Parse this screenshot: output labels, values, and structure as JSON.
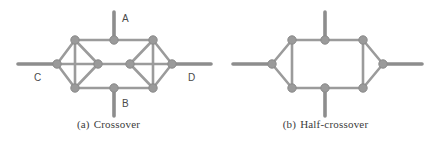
{
  "figure": {
    "width": 434,
    "height": 144,
    "background": "#ffffff",
    "colors": {
      "edge": "#9b9b9b",
      "node_fill": "#9a9a9a",
      "node_stroke": "#8a8a8a",
      "terminal_stem": "#8d8d8d",
      "label_text": "#4a4a4a",
      "caption_text": "#3b3b3b"
    },
    "stroke_widths": {
      "edge": 2.6,
      "terminal_stem": 3.6,
      "node_radius": 4.2
    }
  },
  "panels": [
    {
      "id": "crossover",
      "caption_tag": "(a)",
      "caption_text": "Crossover",
      "type": "graph",
      "nodes": [
        {
          "id": "tl",
          "name": "top-left-node",
          "x": 75,
          "y": 40
        },
        {
          "id": "tm",
          "name": "top-middle-node",
          "x": 114,
          "y": 40
        },
        {
          "id": "tr",
          "name": "top-right-node",
          "x": 153,
          "y": 40
        },
        {
          "id": "bl",
          "name": "bottom-left-node",
          "x": 75,
          "y": 88
        },
        {
          "id": "bm",
          "name": "bottom-middle-node",
          "x": 114,
          "y": 88
        },
        {
          "id": "br",
          "name": "bottom-right-node",
          "x": 153,
          "y": 88
        },
        {
          "id": "lw",
          "name": "left-west-node",
          "x": 57,
          "y": 64
        },
        {
          "id": "cl",
          "name": "center-left-node",
          "x": 98,
          "y": 64
        },
        {
          "id": "cr",
          "name": "center-right-node",
          "x": 130,
          "y": 64
        },
        {
          "id": "re",
          "name": "right-east-node",
          "x": 172,
          "y": 64
        }
      ],
      "edges": [
        {
          "from": "tl",
          "to": "tm"
        },
        {
          "from": "tm",
          "to": "tr"
        },
        {
          "from": "bl",
          "to": "bm"
        },
        {
          "from": "bm",
          "to": "br"
        },
        {
          "from": "tl",
          "to": "lw"
        },
        {
          "from": "lw",
          "to": "bl"
        },
        {
          "from": "tl",
          "to": "bl"
        },
        {
          "from": "tl",
          "to": "cl"
        },
        {
          "from": "bl",
          "to": "cl"
        },
        {
          "from": "lw",
          "to": "cl"
        },
        {
          "from": "tr",
          "to": "re"
        },
        {
          "from": "re",
          "to": "br"
        },
        {
          "from": "tr",
          "to": "br"
        },
        {
          "from": "tr",
          "to": "cr"
        },
        {
          "from": "br",
          "to": "cr"
        },
        {
          "from": "re",
          "to": "cr"
        },
        {
          "from": "cl",
          "to": "cr"
        }
      ],
      "terminals": [
        {
          "id": "A",
          "name": "terminal-stem-a",
          "x1": 114,
          "y1": 40,
          "x2": 114,
          "y2": 12
        },
        {
          "id": "B",
          "name": "terminal-stem-b",
          "x1": 114,
          "y1": 88,
          "x2": 114,
          "y2": 116
        },
        {
          "id": "C",
          "name": "terminal-stem-c",
          "x1": 57,
          "y1": 64,
          "x2": 18,
          "y2": 64
        },
        {
          "id": "D",
          "name": "terminal-stem-d",
          "x1": 172,
          "y1": 64,
          "x2": 211,
          "y2": 64
        }
      ],
      "port_labels": [
        {
          "id": "A",
          "name": "port-label-a",
          "text": "A",
          "x": 122,
          "y": 14
        },
        {
          "id": "B",
          "name": "port-label-b",
          "text": "B",
          "x": 122,
          "y": 99
        },
        {
          "id": "C",
          "name": "port-label-c",
          "text": "C",
          "x": 34,
          "y": 73
        },
        {
          "id": "D",
          "name": "port-label-d",
          "text": "D",
          "x": 188,
          "y": 73
        }
      ]
    },
    {
      "id": "half-crossover",
      "caption_tag": "(b)",
      "caption_text": "Half-crossover",
      "type": "graph",
      "nodes": [
        {
          "id": "tl",
          "name": "top-left-node",
          "x": 75,
          "y": 40
        },
        {
          "id": "tm",
          "name": "top-middle-node",
          "x": 108,
          "y": 40
        },
        {
          "id": "tr",
          "name": "top-right-node",
          "x": 146,
          "y": 40
        },
        {
          "id": "bl",
          "name": "bottom-left-node",
          "x": 75,
          "y": 88
        },
        {
          "id": "bm",
          "name": "bottom-middle-node",
          "x": 108,
          "y": 88
        },
        {
          "id": "br",
          "name": "bottom-right-node",
          "x": 146,
          "y": 88
        },
        {
          "id": "lw",
          "name": "left-west-node",
          "x": 55,
          "y": 64
        },
        {
          "id": "re",
          "name": "right-east-node",
          "x": 166,
          "y": 64
        }
      ],
      "edges": [
        {
          "from": "tl",
          "to": "tm"
        },
        {
          "from": "tm",
          "to": "tr"
        },
        {
          "from": "bl",
          "to": "bm"
        },
        {
          "from": "bm",
          "to": "br"
        },
        {
          "from": "tl",
          "to": "bl"
        },
        {
          "from": "tr",
          "to": "br"
        },
        {
          "from": "tl",
          "to": "lw"
        },
        {
          "from": "lw",
          "to": "bl"
        },
        {
          "from": "tr",
          "to": "re"
        },
        {
          "from": "re",
          "to": "br"
        }
      ],
      "terminals": [
        {
          "id": "north",
          "name": "terminal-stem-north",
          "x1": 108,
          "y1": 40,
          "x2": 108,
          "y2": 12
        },
        {
          "id": "south",
          "name": "terminal-stem-south",
          "x1": 108,
          "y1": 88,
          "x2": 108,
          "y2": 116
        },
        {
          "id": "west",
          "name": "terminal-stem-west",
          "x1": 55,
          "y1": 64,
          "x2": 16,
          "y2": 64
        },
        {
          "id": "east",
          "name": "terminal-stem-east",
          "x1": 166,
          "y1": 64,
          "x2": 205,
          "y2": 64
        }
      ],
      "port_labels": []
    }
  ]
}
